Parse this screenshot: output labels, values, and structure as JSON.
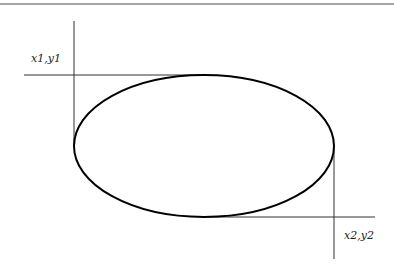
{
  "diagram": {
    "type": "ellipse-bounding-box",
    "labels": {
      "top_left": "x1,y1",
      "bottom_right": "x2,y2"
    },
    "ellipse": {
      "cx": 204,
      "cy": 146,
      "rx": 130,
      "ry": 71
    },
    "colors": {
      "stroke": "#000000",
      "guide": "#333333",
      "border": "#888888",
      "background": "#ffffff"
    }
  }
}
